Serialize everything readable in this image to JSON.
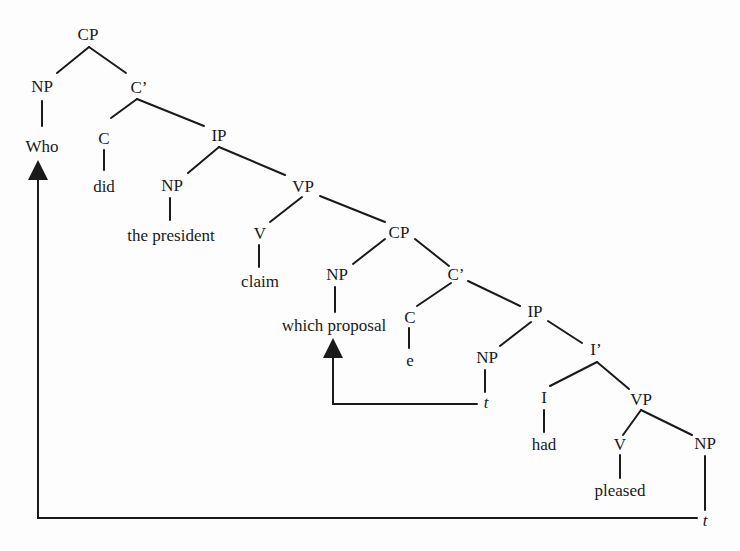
{
  "diagram": {
    "type": "syntax-tree",
    "nodes": [
      {
        "id": "cp1",
        "label": "CP",
        "x": 88,
        "y": 35
      },
      {
        "id": "np1",
        "label": "NP",
        "x": 42,
        "y": 87
      },
      {
        "id": "who",
        "label": "Who",
        "x": 42,
        "y": 147
      },
      {
        "id": "cbar1",
        "label": "C’",
        "x": 139,
        "y": 88
      },
      {
        "id": "c1",
        "label": "C",
        "x": 104,
        "y": 139
      },
      {
        "id": "did",
        "label": "did",
        "x": 104,
        "y": 187
      },
      {
        "id": "ip1",
        "label": "IP",
        "x": 219,
        "y": 136
      },
      {
        "id": "np2",
        "label": "NP",
        "x": 172,
        "y": 186
      },
      {
        "id": "pres",
        "label": "the president",
        "x": 171,
        "y": 236
      },
      {
        "id": "vp1",
        "label": "VP",
        "x": 303,
        "y": 187
      },
      {
        "id": "v1",
        "label": "V",
        "x": 260,
        "y": 234
      },
      {
        "id": "claim",
        "label": "claim",
        "x": 260,
        "y": 282
      },
      {
        "id": "cp2",
        "label": "CP",
        "x": 399,
        "y": 233
      },
      {
        "id": "np3",
        "label": "NP",
        "x": 337,
        "y": 275
      },
      {
        "id": "which",
        "label": "which proposal",
        "x": 334,
        "y": 326
      },
      {
        "id": "cbar2",
        "label": "C’",
        "x": 456,
        "y": 275
      },
      {
        "id": "c2",
        "label": "C",
        "x": 410,
        "y": 318
      },
      {
        "id": "e",
        "label": "e",
        "x": 410,
        "y": 361
      },
      {
        "id": "ip2",
        "label": "IP",
        "x": 535,
        "y": 312
      },
      {
        "id": "np4",
        "label": "NP",
        "x": 487,
        "y": 358
      },
      {
        "id": "t1",
        "label": "t",
        "x": 486,
        "y": 403,
        "italic": true
      },
      {
        "id": "ibar",
        "label": "I’",
        "x": 596,
        "y": 350
      },
      {
        "id": "i",
        "label": "I",
        "x": 544,
        "y": 398
      },
      {
        "id": "had",
        "label": "had",
        "x": 544,
        "y": 445
      },
      {
        "id": "vp2",
        "label": "VP",
        "x": 641,
        "y": 400
      },
      {
        "id": "v2",
        "label": "V",
        "x": 620,
        "y": 445
      },
      {
        "id": "pleased",
        "label": "pleased",
        "x": 620,
        "y": 491
      },
      {
        "id": "np5",
        "label": "NP",
        "x": 705,
        "y": 444
      },
      {
        "id": "t2",
        "label": "t",
        "x": 705,
        "y": 521,
        "italic": true
      }
    ],
    "movement_arrows": [
      {
        "from": "t1",
        "to": "which proposal"
      },
      {
        "from": "t2",
        "to": "Who"
      }
    ]
  }
}
